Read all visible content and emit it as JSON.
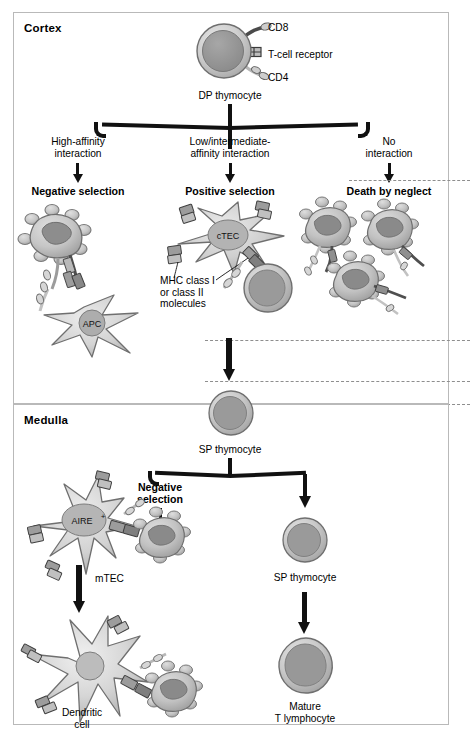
{
  "figure": {
    "background": "#ffffff",
    "panel_border": "#b9b9b9"
  },
  "regions": [
    {
      "id": "cortex",
      "label": "Cortex"
    },
    {
      "id": "medulla",
      "label": "Medulla"
    }
  ],
  "cortex": {
    "top_cell": {
      "name": "DP thymocyte",
      "receptors": [
        {
          "name": "CD8",
          "label": "CD8"
        },
        {
          "name": "tcr",
          "label": "T-cell receptor"
        },
        {
          "name": "CD4",
          "label": "CD4"
        }
      ]
    },
    "branches": [
      {
        "id": "high-affinity",
        "condition": "High-affinity\ninteraction",
        "outcome": "Negative selection",
        "cells": [
          {
            "name": "thymocyte-apoptotic",
            "label": ""
          },
          {
            "name": "APC",
            "label": "APC"
          }
        ]
      },
      {
        "id": "low-intermediate-affinity",
        "condition": "Low/intermediate-\naffinity interaction",
        "outcome": "Positive selection",
        "cells": [
          {
            "name": "cTEC",
            "label": "cTEC"
          },
          {
            "name": "thymocyte",
            "label": ""
          }
        ],
        "annotation": "MHC class I\nor class II\nmolecules"
      },
      {
        "id": "no-interaction",
        "condition": "No\ninteraction",
        "outcome": "Death by neglect",
        "cells": [
          {
            "name": "apoptotic-thymocyte-1",
            "label": ""
          },
          {
            "name": "apoptotic-thymocyte-2",
            "label": ""
          },
          {
            "name": "apoptotic-thymocyte-3",
            "label": ""
          }
        ]
      }
    ]
  },
  "medulla": {
    "entry_cell": {
      "name": "SP thymocyte",
      "label": "SP thymocyte"
    },
    "branches": [
      {
        "id": "medullary-negative-selection",
        "outcome": "Negative\nselection",
        "cells": [
          {
            "name": "mTEC",
            "label": "mTEC"
          },
          {
            "name": "AIRE-positive",
            "label": "AIRE",
            "superscript": "+"
          },
          {
            "name": "apoptotic-thymocyte",
            "label": ""
          },
          {
            "name": "dendritic-cell",
            "label": "Dendritic\ncell"
          }
        ]
      },
      {
        "id": "survival",
        "cells": [
          {
            "name": "SP thymocyte",
            "label": "SP thymocyte"
          },
          {
            "name": "mature-T-lymphocyte",
            "label": "Mature\nT lymphocyte"
          }
        ]
      }
    ]
  },
  "palette": {
    "cell_outline": "#6d6d6d",
    "cell_fill_light": "#d2d2d2",
    "cell_fill_mid": "#b4b4b4",
    "nucleus": "#8e8e8e",
    "nucleus_dark": "#7a7a7a",
    "arrow": "#111111",
    "dashed_rule": "#8e8e8e"
  }
}
